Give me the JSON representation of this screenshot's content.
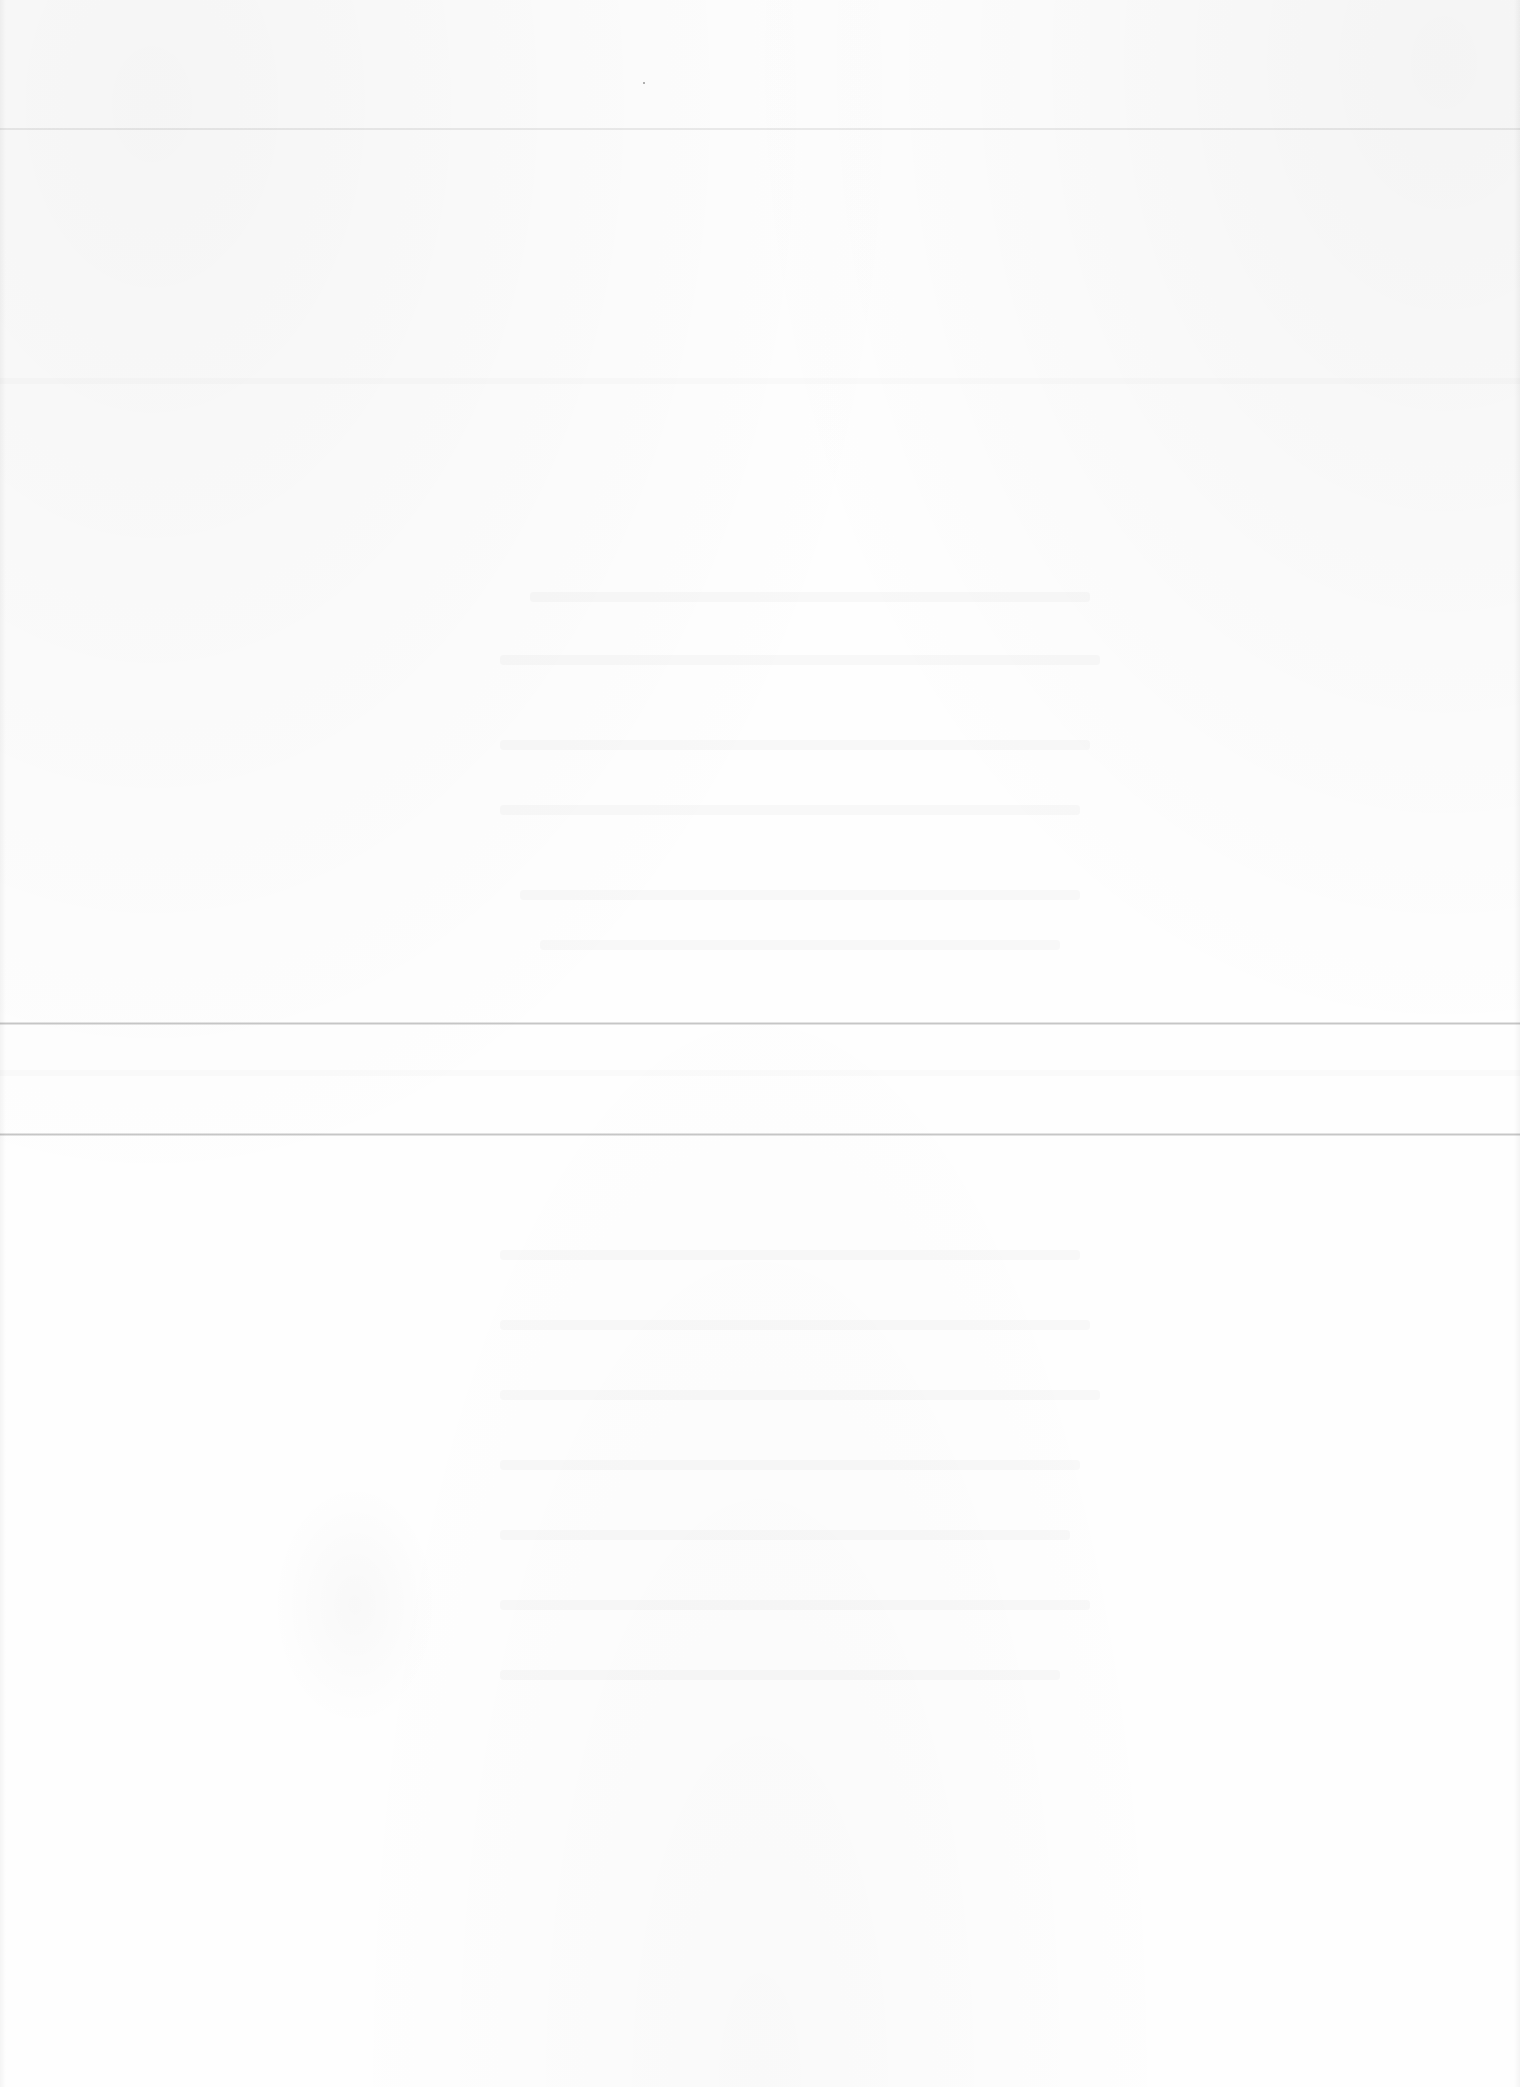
{
  "document": {
    "type": "blank-page-with-show-through",
    "legible_text": [],
    "colors": {
      "paper": "#fdfdfd",
      "crease": "#9a9a9a",
      "ghost_ink": "#e8e8e8"
    },
    "creases_y_px": [
      128,
      1022,
      1133
    ]
  }
}
